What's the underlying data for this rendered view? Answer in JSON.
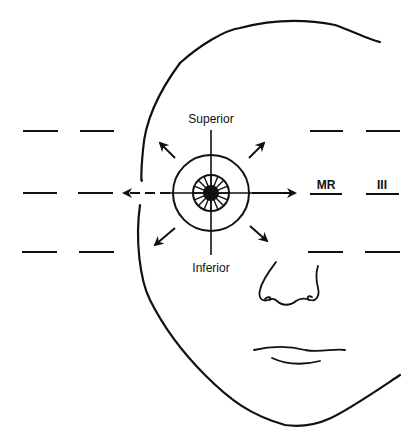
{
  "figure": {
    "labels": {
      "superior": "Superior",
      "inferior": "Inferior",
      "muscle": "MR",
      "nerve": "III"
    },
    "gaze_arrows": [
      "up-left",
      "up-right",
      "left",
      "right",
      "down-left",
      "down-right"
    ],
    "colors": {
      "line": "#111111",
      "background": "#ffffff"
    }
  }
}
